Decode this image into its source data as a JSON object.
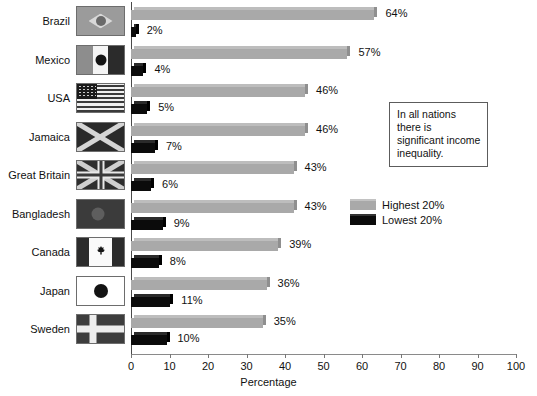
{
  "chart_data": {
    "type": "bar",
    "orientation": "horizontal",
    "title": "",
    "xlabel": "Percentage",
    "ylabel": "",
    "xlim": [
      0,
      100
    ],
    "xticks": [
      0,
      10,
      20,
      30,
      40,
      50,
      60,
      70,
      80,
      90,
      100
    ],
    "grid": false,
    "legend_position": "right",
    "categories": [
      "Brazil",
      "Mexico",
      "USA",
      "Jamaica",
      "Great Britain",
      "Bangladesh",
      "Canada",
      "Japan",
      "Sweden"
    ],
    "series": [
      {
        "name": "Highest 20%",
        "color": "#a9a9a9",
        "values": [
          64,
          57,
          46,
          46,
          43,
          43,
          39,
          36,
          35
        ],
        "labels": [
          "64%",
          "57%",
          "46%",
          "46%",
          "43%",
          "43%",
          "39%",
          "36%",
          "35%"
        ]
      },
      {
        "name": "Lowest 20%",
        "color": "#0b0b0b",
        "values": [
          2,
          4,
          5,
          7,
          6,
          9,
          8,
          11,
          10
        ],
        "labels": [
          "2%",
          "4%",
          "5%",
          "7%",
          "6%",
          "9%",
          "8%",
          "11%",
          "10%"
        ]
      }
    ],
    "annotations": [
      {
        "text": "In all nations there is significant income inequality."
      }
    ],
    "flags": [
      "brazil-flag",
      "mexico-flag",
      "usa-flag",
      "jamaica-flag",
      "great-britain-flag",
      "bangladesh-flag",
      "canada-flag",
      "japan-flag",
      "sweden-flag"
    ]
  },
  "axis": {
    "xlabel": "Percentage",
    "tick_labels": [
      "0",
      "10",
      "20",
      "30",
      "40",
      "50",
      "60",
      "70",
      "80",
      "90",
      "100"
    ]
  },
  "legend": {
    "items": [
      {
        "label": "Highest 20%",
        "swatch": "high"
      },
      {
        "label": "Lowest 20%",
        "swatch": "low"
      }
    ]
  },
  "callout": {
    "text": "In all nations there is significant income inequality."
  }
}
